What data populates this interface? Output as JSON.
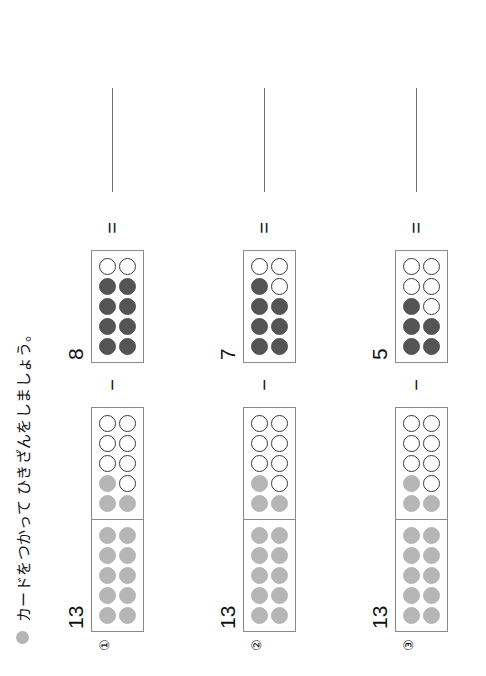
{
  "worksheet": {
    "title": "カードをつかって ひきざんをしましょう。",
    "bullet_icon": "filled-circle-bullet",
    "minus_sign": "−",
    "equals_sign": "=",
    "colors": {
      "minuend_dot": "#b6b6b6",
      "subtrahend_dot": "#545454",
      "open_dot_border": "#3a3a3a",
      "card_border": "#8a8a8a",
      "answer_line": "#6e6e6e"
    }
  },
  "problems": [
    {
      "number": "①",
      "minuend": {
        "label": "13",
        "value": 13,
        "frames": [
          {
            "capacity": 10,
            "filled": 10,
            "open": 0,
            "style": "light"
          },
          {
            "capacity": 10,
            "filled": 3,
            "open": 7,
            "style": "light"
          }
        ]
      },
      "operator": "−",
      "subtrahend": {
        "label": "8",
        "value": 8,
        "frames": [
          {
            "capacity": 10,
            "filled": 8,
            "open": 2,
            "style": "dark"
          }
        ]
      },
      "equals": "=",
      "answer": ""
    },
    {
      "number": "②",
      "minuend": {
        "label": "13",
        "value": 13,
        "frames": [
          {
            "capacity": 10,
            "filled": 10,
            "open": 0,
            "style": "light"
          },
          {
            "capacity": 10,
            "filled": 3,
            "open": 7,
            "style": "light"
          }
        ]
      },
      "operator": "−",
      "subtrahend": {
        "label": "7",
        "value": 7,
        "frames": [
          {
            "capacity": 10,
            "filled": 7,
            "open": 3,
            "style": "dark"
          }
        ]
      },
      "equals": "=",
      "answer": ""
    },
    {
      "number": "③",
      "minuend": {
        "label": "13",
        "value": 13,
        "frames": [
          {
            "capacity": 10,
            "filled": 10,
            "open": 0,
            "style": "light"
          },
          {
            "capacity": 10,
            "filled": 3,
            "open": 7,
            "style": "light"
          }
        ]
      },
      "operator": "−",
      "subtrahend": {
        "label": "5",
        "value": 5,
        "frames": [
          {
            "capacity": 10,
            "filled": 5,
            "open": 5,
            "style": "dark"
          }
        ]
      },
      "equals": "=",
      "answer": ""
    }
  ]
}
